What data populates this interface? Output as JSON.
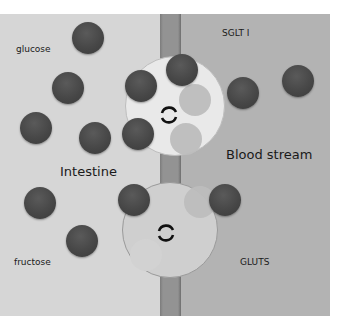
{
  "labels": {
    "glucose": "glucose",
    "intestine": "Intestine",
    "fructose": "fructose",
    "sglt": "SGLT I",
    "blood_stream": "Blood stream",
    "gluts": "GLUTS"
  },
  "colors": {
    "intestine_bg": "#d6d6d6",
    "blood_bg": "#b3b3b3",
    "membrane": "#939393",
    "molecule": "#474747",
    "transporter_sglt": "#e9e9e9",
    "transporter_glut": "#cfcfcf"
  },
  "icons": {
    "transporter_icon": "circular-arrows-icon"
  }
}
